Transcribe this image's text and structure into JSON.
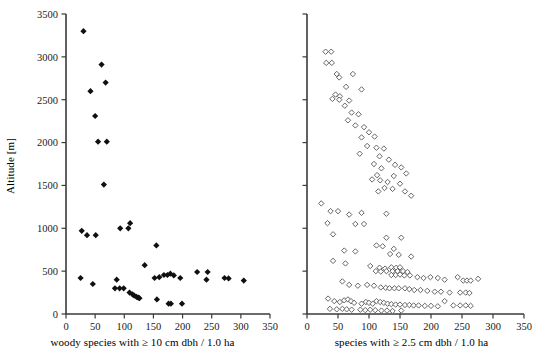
{
  "figure": {
    "type": "scatter-panel-pair",
    "background": "#ffffff",
    "marker_colors": {
      "filled": "#101010",
      "open_stroke": "#555555",
      "open_fill": "#ffffff"
    },
    "axis_color": "#3a3a3a"
  },
  "chart_data": [
    {
      "type": "scatter",
      "panel": "left",
      "title": "",
      "xlabel": "woody species with ≥ 10 cm dbh / 1.0 ha",
      "ylabel": "Altitude [m]",
      "xlim": [
        0,
        350
      ],
      "ylim": [
        0,
        3500
      ],
      "xticks": [
        0,
        50,
        100,
        150,
        200,
        250,
        300,
        350
      ],
      "yticks": [
        0,
        500,
        1000,
        1500,
        2000,
        2500,
        3000,
        3500
      ],
      "xticklabels": [
        "0",
        "50",
        "100",
        "150",
        "200",
        "250",
        "300",
        "350"
      ],
      "yticklabels": [
        "0",
        "500",
        "1000",
        "1500",
        "2000",
        "2500",
        "3000",
        "3500"
      ],
      "grid": false,
      "legend": null,
      "marker": "filled-diamond",
      "points": [
        [
          30,
          3300
        ],
        [
          61,
          2910
        ],
        [
          42,
          2600
        ],
        [
          68,
          2700
        ],
        [
          50,
          2310
        ],
        [
          55,
          2010
        ],
        [
          70,
          2010
        ],
        [
          65,
          1510
        ],
        [
          110,
          1060
        ],
        [
          27,
          970
        ],
        [
          36,
          920
        ],
        [
          51,
          920
        ],
        [
          93,
          1000
        ],
        [
          107,
          1000
        ],
        [
          155,
          800
        ],
        [
          135,
          570
        ],
        [
          25,
          420
        ],
        [
          46,
          350
        ],
        [
          87,
          400
        ],
        [
          84,
          300
        ],
        [
          92,
          300
        ],
        [
          99,
          300
        ],
        [
          109,
          250
        ],
        [
          114,
          230
        ],
        [
          117,
          215
        ],
        [
          121,
          200
        ],
        [
          124,
          190
        ],
        [
          126,
          185
        ],
        [
          152,
          420
        ],
        [
          160,
          430
        ],
        [
          168,
          455
        ],
        [
          174,
          455
        ],
        [
          179,
          470
        ],
        [
          185,
          450
        ],
        [
          196,
          420
        ],
        [
          225,
          490
        ],
        [
          243,
          490
        ],
        [
          241,
          400
        ],
        [
          272,
          420
        ],
        [
          279,
          415
        ],
        [
          305,
          390
        ],
        [
          156,
          170
        ],
        [
          176,
          120
        ],
        [
          180,
          120
        ],
        [
          199,
          120
        ]
      ]
    },
    {
      "type": "scatter",
      "panel": "right",
      "title": "",
      "xlabel": "species with ≥ 2.5 cm dbh / 1.0 ha",
      "ylabel": "",
      "xlim": [
        0,
        350
      ],
      "ylim": [
        0,
        3500
      ],
      "xticks": [
        0,
        50,
        100,
        150,
        200,
        250,
        300,
        350
      ],
      "yticks": [
        0,
        500,
        1000,
        1500,
        2000,
        2500,
        3000,
        3500
      ],
      "xticklabels": [
        "0",
        "50",
        "100",
        "150",
        "200",
        "250",
        "300",
        "350"
      ],
      "yticklabels": [],
      "grid": false,
      "legend": null,
      "marker": "open-diamond",
      "points": [
        [
          30,
          3060
        ],
        [
          39,
          3060
        ],
        [
          31,
          2930
        ],
        [
          40,
          2930
        ],
        [
          48,
          2800
        ],
        [
          52,
          2760
        ],
        [
          74,
          2800
        ],
        [
          63,
          2650
        ],
        [
          46,
          2560
        ],
        [
          53,
          2540
        ],
        [
          41,
          2510
        ],
        [
          52,
          2500
        ],
        [
          61,
          2430
        ],
        [
          68,
          2490
        ],
        [
          88,
          2620
        ],
        [
          72,
          2350
        ],
        [
          83,
          2330
        ],
        [
          66,
          2260
        ],
        [
          78,
          2200
        ],
        [
          92,
          2180
        ],
        [
          100,
          2120
        ],
        [
          88,
          2060
        ],
        [
          109,
          2070
        ],
        [
          97,
          1960
        ],
        [
          112,
          1940
        ],
        [
          124,
          1930
        ],
        [
          85,
          1870
        ],
        [
          117,
          1840
        ],
        [
          132,
          1800
        ],
        [
          108,
          1750
        ],
        [
          142,
          1740
        ],
        [
          120,
          1700
        ],
        [
          152,
          1710
        ],
        [
          113,
          1620
        ],
        [
          140,
          1610
        ],
        [
          160,
          1640
        ],
        [
          105,
          1570
        ],
        [
          118,
          1560
        ],
        [
          130,
          1540
        ],
        [
          150,
          1520
        ],
        [
          125,
          1470
        ],
        [
          138,
          1460
        ],
        [
          115,
          1430
        ],
        [
          158,
          1430
        ],
        [
          168,
          1380
        ],
        [
          23,
          1290
        ],
        [
          38,
          1200
        ],
        [
          50,
          1200
        ],
        [
          68,
          1160
        ],
        [
          88,
          1180
        ],
        [
          128,
          1170
        ],
        [
          33,
          1060
        ],
        [
          78,
          1050
        ],
        [
          92,
          1050
        ],
        [
          42,
          930
        ],
        [
          128,
          890
        ],
        [
          152,
          890
        ],
        [
          112,
          800
        ],
        [
          122,
          790
        ],
        [
          140,
          760
        ],
        [
          60,
          740
        ],
        [
          78,
          730
        ],
        [
          134,
          700
        ],
        [
          148,
          690
        ],
        [
          168,
          670
        ],
        [
          42,
          620
        ],
        [
          62,
          590
        ],
        [
          102,
          560
        ],
        [
          117,
          540
        ],
        [
          126,
          530
        ],
        [
          136,
          545
        ],
        [
          144,
          540
        ],
        [
          150,
          545
        ],
        [
          111,
          500
        ],
        [
          119,
          495
        ],
        [
          128,
          500
        ],
        [
          138,
          500
        ],
        [
          146,
          500
        ],
        [
          155,
          500
        ],
        [
          162,
          490
        ],
        [
          136,
          455
        ],
        [
          143,
          455
        ],
        [
          150,
          460
        ],
        [
          157,
          450
        ],
        [
          166,
          450
        ],
        [
          178,
          430
        ],
        [
          188,
          420
        ],
        [
          199,
          430
        ],
        [
          211,
          420
        ],
        [
          222,
          400
        ],
        [
          243,
          430
        ],
        [
          252,
          390
        ],
        [
          258,
          390
        ],
        [
          264,
          390
        ],
        [
          276,
          410
        ],
        [
          57,
          380
        ],
        [
          68,
          340
        ],
        [
          82,
          330
        ],
        [
          97,
          340
        ],
        [
          108,
          330
        ],
        [
          119,
          310
        ],
        [
          127,
          305
        ],
        [
          133,
          300
        ],
        [
          141,
          300
        ],
        [
          148,
          300
        ],
        [
          158,
          300
        ],
        [
          165,
          290
        ],
        [
          173,
          280
        ],
        [
          183,
          280
        ],
        [
          194,
          270
        ],
        [
          206,
          260
        ],
        [
          216,
          260
        ],
        [
          230,
          250
        ],
        [
          247,
          250
        ],
        [
          256,
          250
        ],
        [
          262,
          245
        ],
        [
          34,
          180
        ],
        [
          44,
          150
        ],
        [
          53,
          140
        ],
        [
          60,
          160
        ],
        [
          66,
          170
        ],
        [
          71,
          150
        ],
        [
          76,
          130
        ],
        [
          88,
          120
        ],
        [
          95,
          140
        ],
        [
          100,
          130
        ],
        [
          106,
          120
        ],
        [
          112,
          150
        ],
        [
          118,
          140
        ],
        [
          124,
          130
        ],
        [
          130,
          120
        ],
        [
          136,
          115
        ],
        [
          143,
          110
        ],
        [
          150,
          110
        ],
        [
          158,
          105
        ],
        [
          165,
          105
        ],
        [
          172,
          100
        ],
        [
          180,
          100
        ],
        [
          190,
          95
        ],
        [
          200,
          95
        ],
        [
          211,
          90
        ],
        [
          222,
          150
        ],
        [
          236,
          100
        ],
        [
          247,
          100
        ],
        [
          256,
          100
        ],
        [
          264,
          95
        ],
        [
          37,
          60
        ],
        [
          48,
          55
        ],
        [
          57,
          60
        ],
        [
          64,
          55
        ],
        [
          72,
          50
        ],
        [
          86,
          50
        ],
        [
          94,
          45
        ],
        [
          102,
          50
        ],
        [
          110,
          45
        ],
        [
          120,
          40
        ],
        [
          129,
          40
        ],
        [
          138,
          35
        ],
        [
          152,
          40
        ]
      ]
    }
  ]
}
